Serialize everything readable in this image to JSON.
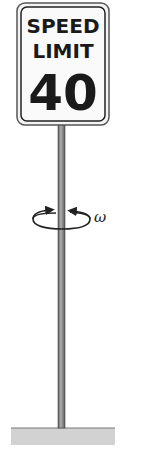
{
  "diagram": {
    "sign": {
      "line1": "SPEED",
      "line2": "LIMIT",
      "line3": "40"
    },
    "rotation": {
      "symbol": "ω"
    }
  },
  "colors": {
    "pole": "#8a8a8a",
    "pole_edge": "#555555",
    "ground": "#cfcfcf",
    "sign_border": "#444444"
  }
}
